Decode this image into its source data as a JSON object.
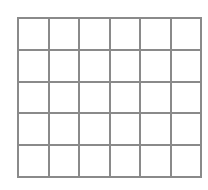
{
  "grid": {
    "rows": 5,
    "columns": 6,
    "line_color": "#8a8a8a",
    "background": "#ffffff"
  }
}
